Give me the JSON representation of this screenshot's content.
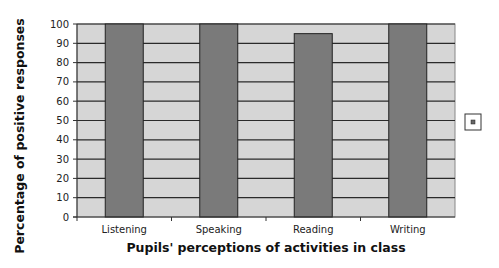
{
  "chart_data": {
    "type": "bar",
    "title": "",
    "xlabel": "Pupils' perceptions of activities in class",
    "ylabel": "Percentage of positive responses",
    "categories": [
      "Listening",
      "Speaking",
      "Reading",
      "Writing"
    ],
    "values": [
      100,
      100,
      95,
      100
    ],
    "ylim": [
      0,
      100
    ],
    "yticks": [
      0,
      10,
      20,
      30,
      40,
      50,
      60,
      70,
      80,
      90,
      100
    ],
    "grid": true,
    "legend": {
      "position": "right",
      "entries": [
        ""
      ]
    },
    "colors": {
      "bar": "#7a7a7a",
      "bar_border": "#222222",
      "plot_bg": "#d6d6d6",
      "grid": "#2a2a2a"
    }
  }
}
